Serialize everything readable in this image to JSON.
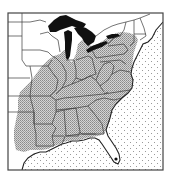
{
  "map": {
    "type": "species range map",
    "region": "Eastern United States",
    "style": "black-and-white line map",
    "legend": [],
    "title": "",
    "colors": {
      "background": "#ffffff",
      "land": "#ffffff",
      "range_fill": "#bdbdbd",
      "range_dot": "#8a8a8a",
      "ocean_dot": "#9a9a9a",
      "lakes": "#111111",
      "borders": "#333333",
      "frame": "#444444"
    },
    "features": {
      "ocean": "Atlantic Ocean and Gulf of Mexico (dotted pattern)",
      "lakes": "Great Lakes (solid black)",
      "range": "Shaded range covering the eastern and southeastern states from the Great Lakes south to the Gulf coast, excluding peninsular Florida, northern New England and the upper Midwest",
      "marker": "Single black dot in southern Florida"
    }
  }
}
